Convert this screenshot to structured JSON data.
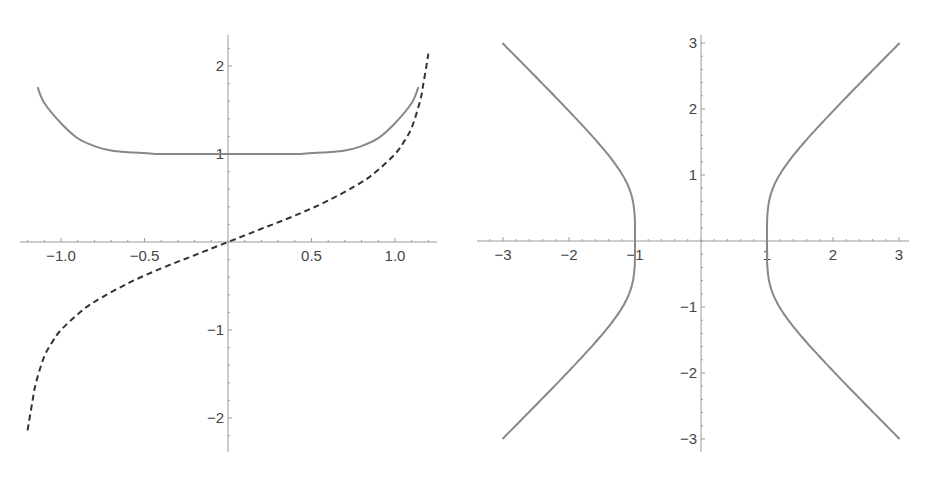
{
  "chart_data": [
    {
      "type": "line",
      "title": "",
      "xlabel": "",
      "ylabel": "",
      "xlim": [
        -1.25,
        1.25
      ],
      "ylim": [
        -2.35,
        2.35
      ],
      "grid": false,
      "legend": null,
      "x_ticks": [
        -1.0,
        -0.5,
        0.5,
        1.0
      ],
      "x_tick_labels": [
        "−1.0",
        "−0.5",
        "0.5",
        "1.0"
      ],
      "y_ticks": [
        -2,
        -1,
        1,
        2
      ],
      "y_tick_labels": [
        "−2",
        "−1",
        "1",
        "2"
      ],
      "series": [
        {
          "name": "solid",
          "style": "solid",
          "color": "#888888",
          "x": [
            -1.14,
            -1.1,
            -1.0,
            -0.9,
            -0.8,
            -0.7,
            -0.6,
            -0.5,
            -0.4,
            -0.2,
            0.0,
            0.2,
            0.4,
            0.5,
            0.6,
            0.7,
            0.8,
            0.9,
            1.0,
            1.1,
            1.14
          ],
          "y": [
            1.76,
            1.58,
            1.35,
            1.18,
            1.09,
            1.04,
            1.02,
            1.01,
            1.0,
            1.0,
            1.0,
            1.0,
            1.0,
            1.01,
            1.02,
            1.04,
            1.09,
            1.18,
            1.35,
            1.58,
            1.76
          ]
        },
        {
          "name": "dashed",
          "style": "dashed",
          "color": "#333333",
          "x": [
            -1.2,
            -1.17,
            -1.15,
            -1.1,
            -1.05,
            -1.0,
            -0.9,
            -0.8,
            -0.6,
            -0.4,
            -0.2,
            0.0,
            0.2,
            0.4,
            0.6,
            0.8,
            0.9,
            1.0,
            1.05,
            1.1,
            1.15,
            1.17,
            1.2
          ],
          "y": [
            -2.14,
            -1.8,
            -1.6,
            -1.3,
            -1.13,
            -1.0,
            -0.82,
            -0.68,
            -0.47,
            -0.3,
            -0.15,
            0.0,
            0.15,
            0.3,
            0.47,
            0.68,
            0.82,
            1.0,
            1.13,
            1.3,
            1.6,
            1.8,
            2.14
          ]
        }
      ]
    },
    {
      "type": "line",
      "title": "",
      "xlabel": "",
      "ylabel": "",
      "xlim": [
        -3.1,
        3.1
      ],
      "ylim": [
        -3.15,
        3.15
      ],
      "grid": false,
      "legend": null,
      "x_ticks": [
        -3,
        -2,
        -1,
        1,
        2,
        3
      ],
      "x_tick_labels": [
        "−3",
        "−2",
        "−1",
        "1",
        "2",
        "3"
      ],
      "y_ticks": [
        -3,
        -2,
        -1,
        1,
        2,
        3
      ],
      "y_tick_labels": [
        "−3",
        "−2",
        "−1",
        "1",
        "2",
        "3"
      ],
      "curve_equation": "x^4 - y^4 = 1",
      "series": [
        {
          "name": "right-branch",
          "style": "solid",
          "color": "#888888",
          "y": [
            -3,
            -2.5,
            -2,
            -1.5,
            -1,
            -0.75,
            -0.5,
            -0.25,
            0,
            0.25,
            0.5,
            0.75,
            1,
            1.5,
            2,
            2.5,
            3
          ],
          "x": [
            3.009,
            2.515,
            2.03,
            1.575,
            1.189,
            1.108,
            1.015,
            1.001,
            1.0,
            1.001,
            1.015,
            1.108,
            1.189,
            1.575,
            2.03,
            2.515,
            3.009
          ]
        },
        {
          "name": "left-branch",
          "style": "solid",
          "color": "#888888",
          "y": [
            -3,
            -2.5,
            -2,
            -1.5,
            -1,
            -0.75,
            -0.5,
            -0.25,
            0,
            0.25,
            0.5,
            0.75,
            1,
            1.5,
            2,
            2.5,
            3
          ],
          "x": [
            -3.009,
            -2.515,
            -2.03,
            -1.575,
            -1.189,
            -1.108,
            -1.015,
            -1.001,
            -1.0,
            -1.001,
            -1.015,
            -1.108,
            -1.189,
            -1.575,
            -2.03,
            -2.515,
            -3.009
          ]
        }
      ]
    }
  ],
  "colors": {
    "axis": "#9a9a9a",
    "tick_label": "#444444",
    "solid_curve": "#888888",
    "dashed_curve": "#333333"
  },
  "layout": {
    "left": {
      "origin": [
        228,
        242
      ],
      "x_scale": 167,
      "y_scale": 88,
      "x_axis_range_px": [
        20,
        437
      ],
      "y_axis_range_px": [
        35,
        452
      ]
    },
    "right": {
      "origin": [
        236,
        241
      ],
      "x_scale": 66,
      "y_scale": 66,
      "x_axis_range_px": [
        12,
        444
      ],
      "y_axis_range_px": [
        35,
        452
      ]
    }
  }
}
